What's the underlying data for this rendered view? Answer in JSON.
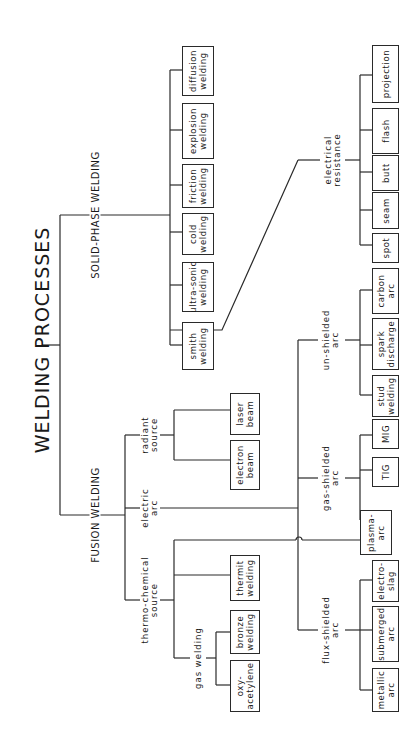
{
  "title": "WELDING PROCESSES",
  "branches": {
    "solid_phase": {
      "label": "SOLID-PHASE WELDING",
      "processes": [
        "diffusion\nwelding",
        "explosion\nwelding",
        "friction\nwelding",
        "cold\nwelding",
        "ultra-sonic\nwelding",
        "smith\nwelding"
      ]
    },
    "fusion": {
      "label": "FUSION WELDING",
      "sources": {
        "radiant": {
          "label": "radiant\nsource",
          "processes": [
            "laser\nbeam",
            "electron\nbeam"
          ]
        },
        "electric_arc": {
          "label": "electric\narc"
        },
        "thermo_chemical": {
          "label": "thermo-chemical\nsource",
          "processes": [
            "thermit\nwelding"
          ],
          "gas_welding": {
            "label": "gas welding",
            "processes": [
              "bronze\nwelding",
              "oxy-\nacetylene"
            ]
          }
        }
      }
    },
    "electric_arc_types": {
      "electrical_resistance": {
        "label": "electrical\nresistance",
        "processes": [
          "projection",
          "flash",
          "butt",
          "seam",
          "spot"
        ]
      },
      "un_shielded": {
        "label": "un-shielded\narc",
        "processes": [
          "carbon\narc",
          "spark\ndischarge",
          "stud\nwelding"
        ]
      },
      "gas_shielded": {
        "label": "gas-shielded\narc",
        "processes": [
          "MIG",
          "TIG",
          "plasma-\narc"
        ]
      },
      "flux_shielded": {
        "label": "flux-shielded\narc",
        "processes": [
          "electro-\nslag",
          "submerged\narc",
          "metallic\narc"
        ]
      }
    }
  }
}
